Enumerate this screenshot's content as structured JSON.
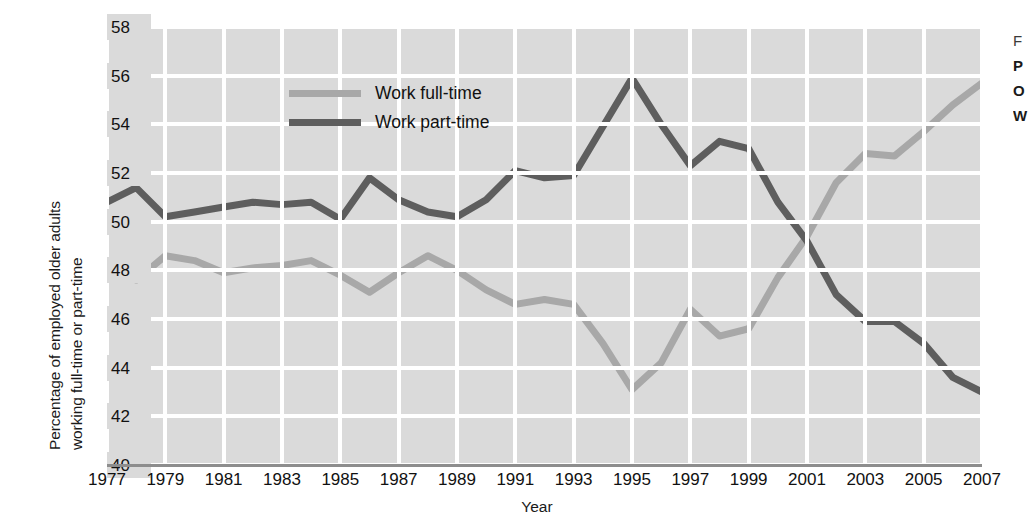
{
  "chart_data": {
    "type": "line",
    "title": "",
    "xlabel": "Year",
    "ylabel": "Percentage of employed older adults working full-time or part-time",
    "ylabel_line1": "Percentage of employed older adults",
    "ylabel_line2": "working full-time or part-time",
    "ylim": [
      40,
      58
    ],
    "yticks": [
      40,
      42,
      44,
      46,
      48,
      50,
      52,
      54,
      56,
      58
    ],
    "xlim": [
      1977,
      2007
    ],
    "xticks": [
      1977,
      1979,
      1981,
      1983,
      1985,
      1987,
      1989,
      1991,
      1993,
      1995,
      1997,
      1999,
      2001,
      2003,
      2005,
      2007
    ],
    "grid": true,
    "legend_position": "top-left-inside",
    "x": [
      1977,
      1978,
      1979,
      1980,
      1981,
      1982,
      1983,
      1984,
      1985,
      1986,
      1987,
      1988,
      1989,
      1990,
      1991,
      1992,
      1993,
      1994,
      1995,
      1996,
      1997,
      1998,
      1999,
      2000,
      2001,
      2002,
      2003,
      2004,
      2005,
      2006,
      2007
    ],
    "series": [
      {
        "name": "Work full-time",
        "color": "#a8a8a8",
        "values": [
          48.1,
          47.6,
          48.6,
          48.4,
          47.9,
          48.1,
          48.2,
          48.4,
          47.8,
          47.1,
          47.9,
          48.6,
          48.0,
          47.2,
          46.6,
          46.8,
          46.6,
          45.0,
          43.1,
          44.2,
          46.4,
          45.3,
          45.6,
          47.7,
          49.4,
          51.6,
          52.8,
          52.7,
          53.7,
          54.8,
          55.7
        ]
      },
      {
        "name": "Work part-time",
        "color": "#5e5e5e",
        "values": [
          50.8,
          51.4,
          50.2,
          50.4,
          50.6,
          50.8,
          50.7,
          50.8,
          50.1,
          51.8,
          50.9,
          50.4,
          50.2,
          50.9,
          52.1,
          51.8,
          51.9,
          53.9,
          55.9,
          54.0,
          52.3,
          53.3,
          53.0,
          50.8,
          49.2,
          47.0,
          45.9,
          45.9,
          45.0,
          43.6,
          43.0
        ]
      }
    ]
  },
  "legend": {
    "items": [
      {
        "label": "Work full-time",
        "color": "#a8a8a8"
      },
      {
        "label": "Work part-time",
        "color": "#5e5e5e"
      }
    ]
  },
  "side_caption": {
    "line1": "F",
    "line2": "P",
    "line3": "O",
    "line4": "W"
  },
  "colors": {
    "plot_background": "#dadada",
    "gridline": "#ffffff",
    "axis_line": "#8d8d8d",
    "page_background": "#ffffff",
    "full_time": "#a8a8a8",
    "part_time": "#5e5e5e"
  }
}
